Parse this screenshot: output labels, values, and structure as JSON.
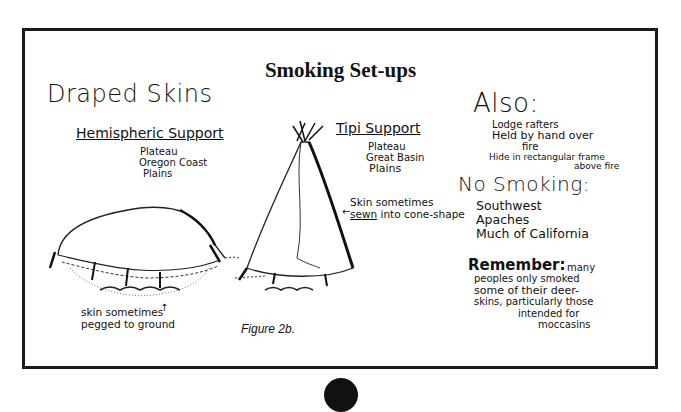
{
  "title": "Smoking Set-ups",
  "caption": "Figure 2b.",
  "draped_skins": {
    "heading": "Draped Skins",
    "hemispheric": {
      "label": "Hemispheric Support",
      "regions": [
        "Plateau",
        "Oregon Coast",
        "Plains"
      ],
      "note_line1": "skin sometimes",
      "note_line2": "pegged to ground"
    },
    "tipi": {
      "label": "Tipi Support",
      "regions": [
        "Plateau",
        "Great Basin",
        "Plains"
      ],
      "note_line1": "Skin sometimes",
      "note_sewn": "sewn",
      "note_rest": "into cone-shape"
    }
  },
  "also": {
    "heading": "Also:",
    "items": [
      "Lodge rafters",
      "Held by hand over",
      "fire",
      "Hide in rectangular frame",
      "above fire"
    ]
  },
  "no_smoking": {
    "heading": "No Smoking:",
    "items": [
      "Southwest",
      "Apaches",
      "Much of California"
    ]
  },
  "remember": {
    "heading": "Remember:",
    "lines": [
      "many",
      "peoples only smoked",
      "some of their deer-",
      "skins, particularly those",
      "intended for",
      "moccasins"
    ]
  }
}
